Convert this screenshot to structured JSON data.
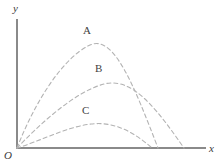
{
  "figure": {
    "title": "",
    "background_color": "#ffffff",
    "width": 221,
    "height": 168
  },
  "axes": {
    "color": "#8a8a8a",
    "stroke_width": 2,
    "origin_label": "O",
    "x_axis_label": "x",
    "y_axis_label": "y",
    "origin_px": {
      "x": 17,
      "y": 148
    },
    "x_axis_end_px": {
      "x": 205,
      "y": 148
    },
    "y_axis_top_px": {
      "x": 17,
      "y": 20
    }
  },
  "curves": {
    "color": "#b3b3b3",
    "stroke_width": 1.1,
    "dash_pattern": "4 3",
    "style": "dashed",
    "items": [
      {
        "label": "A",
        "peak_px": {
          "x": 90,
          "y": 45
        },
        "end_px": {
          "x": 158,
          "y": 148
        },
        "path": "M 17 148 C 34 104, 62 58, 90 45 C 114 34, 134 86, 158 148"
      },
      {
        "label": "B",
        "peak_px": {
          "x": 104,
          "y": 84
        },
        "end_px": {
          "x": 184,
          "y": 148
        },
        "path": "M 17 148 C 38 126, 74 92, 104 84 C 134 76, 160 114, 184 148"
      },
      {
        "label": "C",
        "peak_px": {
          "x": 91,
          "y": 124
        },
        "end_px": {
          "x": 152,
          "y": 148
        },
        "path": "M 17 148 C 38 142, 66 127, 91 124 C 116 121, 136 134, 152 148"
      }
    ]
  },
  "chart_data": {
    "type": "line",
    "title": "",
    "xlabel": "x",
    "ylabel": "y",
    "grid": false,
    "legend": "inline-labels",
    "series": [
      {
        "name": "A",
        "peak_height_rank": 1,
        "label": "A"
      },
      {
        "name": "B",
        "peak_height_rank": 2,
        "label": "B"
      },
      {
        "name": "C",
        "peak_height_rank": 3,
        "label": "C"
      }
    ]
  }
}
